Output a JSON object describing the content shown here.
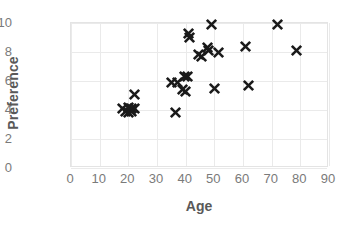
{
  "chart_data": {
    "type": "scatter",
    "title": "",
    "xlabel": "Age",
    "ylabel": "Preference",
    "xlim": [
      0,
      90
    ],
    "ylim": [
      0,
      10
    ],
    "xticks": [
      0,
      10,
      20,
      30,
      40,
      50,
      60,
      70,
      80,
      90
    ],
    "yticks": [
      0,
      2,
      4,
      6,
      8,
      10
    ],
    "grid": true,
    "legend": false,
    "marker": "x-cross",
    "marker_color": "#1a1a1a",
    "series": [
      {
        "name": "Preference vs Age",
        "points": [
          {
            "x": 18,
            "y": 4.1
          },
          {
            "x": 19,
            "y": 3.9
          },
          {
            "x": 20,
            "y": 4.2
          },
          {
            "x": 20,
            "y": 3.8
          },
          {
            "x": 21,
            "y": 4.1
          },
          {
            "x": 21,
            "y": 3.9
          },
          {
            "x": 22,
            "y": 4.1
          },
          {
            "x": 22,
            "y": 5.1
          },
          {
            "x": 35,
            "y": 5.9
          },
          {
            "x": 36.5,
            "y": 3.8
          },
          {
            "x": 37,
            "y": 5.9
          },
          {
            "x": 39,
            "y": 5.4
          },
          {
            "x": 39.5,
            "y": 6.3
          },
          {
            "x": 40,
            "y": 5.3
          },
          {
            "x": 40.5,
            "y": 6.3
          },
          {
            "x": 41,
            "y": 9.3
          },
          {
            "x": 41.5,
            "y": 9.0
          },
          {
            "x": 44.5,
            "y": 7.8
          },
          {
            "x": 45.5,
            "y": 7.7
          },
          {
            "x": 47.5,
            "y": 8.3
          },
          {
            "x": 48,
            "y": 8.1
          },
          {
            "x": 49,
            "y": 9.9
          },
          {
            "x": 50,
            "y": 5.5
          },
          {
            "x": 51.5,
            "y": 8.0
          },
          {
            "x": 61,
            "y": 8.4
          },
          {
            "x": 62,
            "y": 5.7
          },
          {
            "x": 72,
            "y": 9.9
          },
          {
            "x": 78.5,
            "y": 8.1
          }
        ]
      }
    ]
  },
  "axes": {
    "y_title": "Preference",
    "x_title": "Age",
    "y_tick_labels": [
      "0",
      "2",
      "4",
      "6",
      "8",
      "10"
    ],
    "x_tick_labels": [
      "0",
      "10",
      "20",
      "30",
      "40",
      "50",
      "60",
      "70",
      "80",
      "90"
    ]
  },
  "colors": {
    "marker": "#1a1a1a",
    "grid": "#eaeaea",
    "frame": "#e4e4e4",
    "tick_text": "#7a7a7a",
    "title_text": "#595959",
    "background": "#ffffff"
  }
}
